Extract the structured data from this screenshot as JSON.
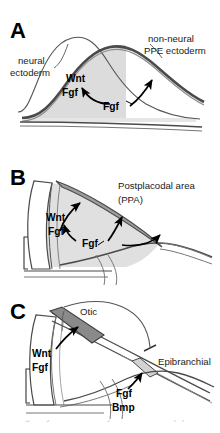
{
  "figure": {
    "panels": [
      {
        "letter": "A",
        "labels": [
          {
            "name": "neural-ectoderm-label",
            "line1": "neural",
            "line2": "ectoderm"
          },
          {
            "name": "non-neural-ppe-ectoderm-label",
            "line1": "non-neural",
            "line2": "PPE ectoderm"
          },
          {
            "name": "wnt-fgf-label",
            "line1": "Wnt",
            "line2": "Fgf"
          },
          {
            "name": "fgf-label",
            "line1": "Fgf"
          }
        ]
      },
      {
        "letter": "B",
        "labels": [
          {
            "name": "postplacodal-area-label",
            "line1": "Postplacodal area",
            "line2": "(PPA)"
          },
          {
            "name": "wnt-fgf-label",
            "line1": "Wnt",
            "line2": "Fgf"
          },
          {
            "name": "fgf-label",
            "line1": "Fgf"
          }
        ]
      },
      {
        "letter": "C",
        "labels": [
          {
            "name": "otic-label",
            "line1": "Otic"
          },
          {
            "name": "epibranchial-label",
            "line1": "Epibranchial"
          },
          {
            "name": "wnt-fgf-label",
            "line1": "Wnt",
            "line2": "Fgf"
          },
          {
            "name": "fgf-bmp-label",
            "line1": "Fgf",
            "line2": "Bmp"
          }
        ]
      }
    ],
    "colors": {
      "ink": "#1a1a1a",
      "outline": "#555555",
      "light_fill": "#dcdcdc",
      "mid_fill": "#c4c4c4",
      "dark_fill": "#808080",
      "background": "#ffffff"
    },
    "caption_clipped": "a single layer of the embryonic ectoderm. (A) At"
  },
  "panel_a": {
    "letter": "A",
    "neural_ectoderm": "neural",
    "neural_ectoderm_2": "ectoderm",
    "non_neural": "non-neural",
    "non_neural_2": "PPE ectoderm",
    "wnt": "Wnt",
    "fgf": "Fgf",
    "fgf_arrow": "Fgf"
  },
  "panel_b": {
    "letter": "B",
    "ppa": "Postplacodal area",
    "ppa_2": "(PPA)",
    "wnt": "Wnt",
    "fgf": "Fgf",
    "fgf_arrow": "Fgf"
  },
  "panel_c": {
    "letter": "C",
    "otic": "Otic",
    "epibranchial": "Epibranchial",
    "wnt": "Wnt",
    "fgf": "Fgf",
    "fgf2": "Fgf",
    "bmp": "Bmp"
  }
}
